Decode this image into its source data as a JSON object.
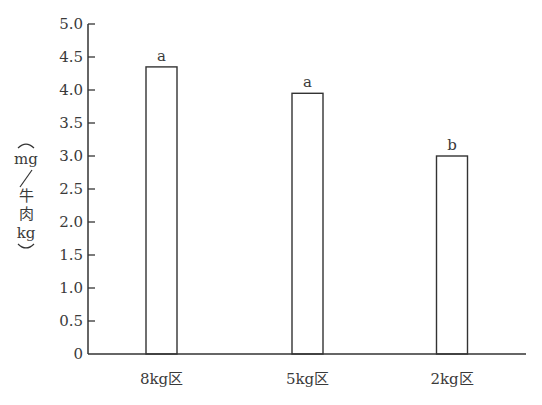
{
  "chart_data": {
    "type": "bar",
    "title": "",
    "xlabel": "",
    "ylabel": "(mg/牛肉kg)",
    "ylabel_parts": [
      "mg",
      "/",
      "牛",
      "肉",
      "kg"
    ],
    "categories": [
      "8kg区",
      "5kg区",
      "2kg区"
    ],
    "values": [
      4.35,
      3.95,
      3.0
    ],
    "significance_labels": [
      "a",
      "a",
      "b"
    ],
    "ylim": [
      0,
      5.0
    ],
    "yticks": [
      0,
      0.5,
      1.0,
      1.5,
      2.0,
      2.5,
      3.0,
      3.5,
      4.0,
      4.5,
      5.0
    ],
    "ytick_labels": [
      "0",
      "0.5",
      "1.0",
      "1.5",
      "2.0",
      "2.5",
      "3.0",
      "3.5",
      "4.0",
      "4.5",
      "5.0"
    ],
    "grid": false,
    "legend": null,
    "bar_fill": "#ffffff",
    "bar_stroke": "#333333"
  }
}
